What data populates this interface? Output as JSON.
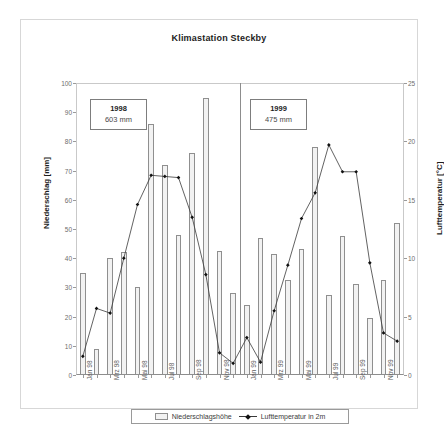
{
  "chart_data": {
    "type": "bar",
    "title": "Klimastation Steckby",
    "xlabel": "",
    "ylabel": "Niederschlag [mm]",
    "y2label": "Lufttemperatur [°C]",
    "ylim": [
      0,
      100
    ],
    "y2lim": [
      0,
      25
    ],
    "yticks": [
      0,
      10,
      20,
      30,
      40,
      50,
      60,
      70,
      80,
      90,
      100
    ],
    "y2ticks": [
      0,
      5,
      10,
      15,
      20,
      25
    ],
    "grid": false,
    "legend_position": "bottom",
    "categories": [
      "Jan 98",
      "Feb 98",
      "Mrz 98",
      "Apr 98",
      "Mai 98",
      "Jun 98",
      "Jul 98",
      "Aug 98",
      "Sep 98",
      "Okt 98",
      "Nov 98",
      "Dez 98",
      "Jan 99",
      "Feb 99",
      "Mrz 99",
      "Apr 99",
      "Mai 99",
      "Jun 99",
      "Jul 99",
      "Aug 99",
      "Sep 99",
      "Okt 99",
      "Nov 99",
      "Dez 99"
    ],
    "tick_labels": [
      "Jan 98",
      "",
      "Mrz 98",
      "",
      "Mai 98",
      "",
      "Jul 98",
      "",
      "Sep 98",
      "",
      "Nov 98",
      "",
      "Jan 99",
      "",
      "Mrz 99",
      "",
      "Mai 99",
      "",
      "Jul 99",
      "",
      "Sep 99",
      "",
      "Nov 99",
      ""
    ],
    "series": [
      {
        "name": "Niederschlagshöhe",
        "type": "bar",
        "axis": "left",
        "unit": "mm",
        "values": [
          35,
          9,
          40,
          42,
          30,
          86,
          72,
          48,
          76,
          95,
          42.5,
          28,
          24,
          47,
          41.5,
          32.5,
          43,
          78,
          27.5,
          47.5,
          31,
          19.5,
          32.5,
          52
        ]
      },
      {
        "name": "Lufttemperatur in 2m",
        "type": "line",
        "axis": "right",
        "unit": "°C",
        "values": [
          1.6,
          5.7,
          5.3,
          10.0,
          14.6,
          17.1,
          17.0,
          16.9,
          13.5,
          8.6,
          1.9,
          1.0,
          3.2,
          1.1,
          5.5,
          9.4,
          13.4,
          15.6,
          19.7,
          17.4,
          17.4,
          9.6,
          3.6,
          2.9
        ]
      }
    ],
    "annotations": [
      {
        "name": "1998",
        "year": "1998",
        "total": "603 mm"
      },
      {
        "name": "1999",
        "year": "1999",
        "total": "475 mm"
      }
    ],
    "divider": {
      "after_category": "Dez 98",
      "label": "year-separator"
    }
  },
  "legend": {
    "precip_label": "Niederschlagshöhe",
    "temp_label": "Lufttemperatur in 2m"
  },
  "colors": {
    "bar_fill": "#f2f2f2",
    "bar_stroke": "#8f8f8f",
    "line": "#3a3a3a",
    "marker": "#111111",
    "axis": "#9a9a9a",
    "frame": "#d7d7d7",
    "text": "#3b3b3b"
  }
}
